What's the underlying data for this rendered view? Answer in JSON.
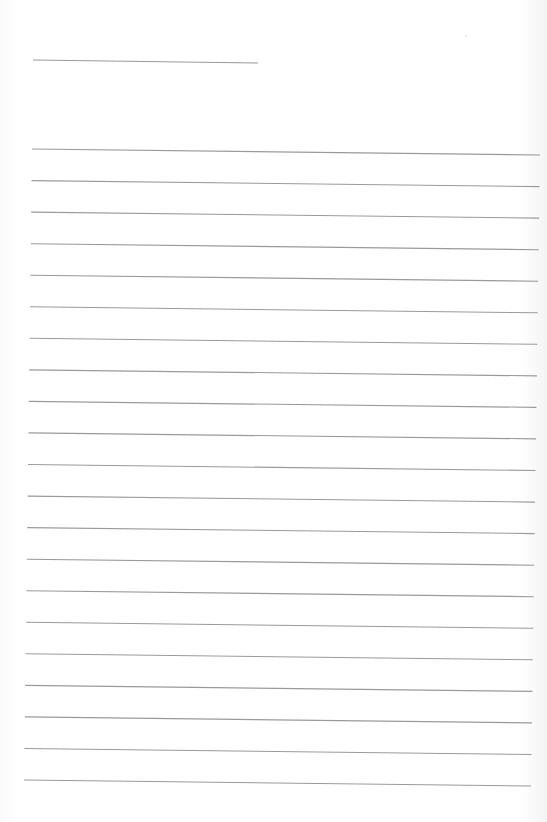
{
  "document": {
    "type": "blank lined writing sheet",
    "background_color": "#ffffff",
    "line_color": "#9a9a9a",
    "header_line": {
      "x1": 33,
      "y1": 60,
      "x2": 258,
      "y2": 63
    },
    "ruled_lines": {
      "count": 21,
      "first_left_y": 149,
      "spacing": 31.55,
      "left_x_top": 32,
      "left_x_bottom": 24,
      "right_x_top": 540,
      "right_x_bottom": 531,
      "slope_drop": 6
    },
    "speck": {
      "x": 466,
      "y": 36
    }
  }
}
